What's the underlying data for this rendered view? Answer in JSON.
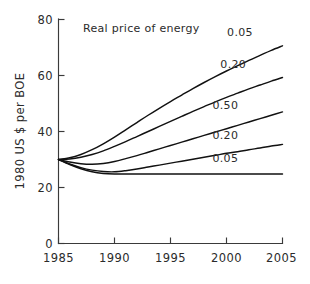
{
  "chart_data": {
    "type": "line",
    "title": "Real price of energy",
    "xlabel": "",
    "ylabel": "1980 US $ per BOE",
    "xlim": [
      1985,
      2005
    ],
    "ylim": [
      0,
      80
    ],
    "xticks": [
      "1985",
      "1990",
      "1995",
      "2000",
      "2005"
    ],
    "xtick_values": [
      1985,
      1990,
      1995,
      2000,
      2005
    ],
    "yticks": [
      "0",
      "20",
      "40",
      "60",
      "80"
    ],
    "ytick_values": [
      0,
      20,
      40,
      60,
      80
    ],
    "grid": false,
    "legend_position": "inline-right-labels",
    "x": [
      1985,
      1986,
      1987,
      1988,
      1989,
      1990,
      1991,
      1992,
      1993,
      1994,
      1995,
      1996,
      1997,
      1998,
      1999,
      2000,
      2001,
      2002,
      2003,
      2004,
      2005
    ],
    "series": [
      {
        "name": "0.05",
        "label": "0.05",
        "label_value": 0.05,
        "values": [
          30.0,
          30.6,
          31.8,
          33.5,
          35.6,
          38.0,
          40.6,
          43.2,
          45.8,
          48.3,
          50.7,
          53.0,
          55.3,
          57.5,
          59.6,
          61.6,
          63.5,
          65.4,
          67.2,
          69.0,
          70.6
        ]
      },
      {
        "name": "0.20-upper",
        "label": "0.20",
        "label_value": 0.2,
        "values": [
          30.0,
          30.2,
          30.8,
          31.8,
          33.1,
          34.7,
          36.4,
          38.2,
          40.0,
          41.8,
          43.6,
          45.4,
          47.2,
          48.9,
          50.6,
          52.2,
          53.7,
          55.2,
          56.6,
          58.0,
          59.3
        ]
      },
      {
        "name": "0.50",
        "label": "0.50",
        "label_value": 0.5,
        "values": [
          30.0,
          29.1,
          28.5,
          28.3,
          28.6,
          29.3,
          30.3,
          31.4,
          32.6,
          33.8,
          35.0,
          36.2,
          37.4,
          38.6,
          39.8,
          41.0,
          42.2,
          43.4,
          44.6,
          45.8,
          47.0
        ]
      },
      {
        "name": "0.20-lower",
        "label": "0.20",
        "label_value": 0.2,
        "values": [
          30.0,
          28.4,
          27.1,
          26.2,
          25.7,
          25.6,
          26.0,
          26.6,
          27.3,
          28.0,
          28.7,
          29.4,
          30.1,
          30.8,
          31.5,
          32.2,
          32.8,
          33.5,
          34.1,
          34.8,
          35.4
        ]
      },
      {
        "name": "0.05-lower",
        "label": "0.05",
        "label_value": 0.05,
        "values": [
          30.0,
          28.2,
          26.7,
          25.6,
          25.0,
          24.8,
          24.8,
          24.8,
          24.8,
          24.8,
          24.8,
          24.8,
          24.8,
          24.8,
          24.8,
          24.8,
          24.8,
          24.8,
          24.8,
          24.8,
          24.8
        ]
      }
    ],
    "curve_labels": [
      {
        "text": "0.05",
        "x": 2001.2,
        "y": 74.0
      },
      {
        "text": "0.20",
        "x": 2000.6,
        "y": 62.8
      },
      {
        "text": "0.50",
        "x": 1999.9,
        "y": 48.0
      },
      {
        "text": "0.20",
        "x": 1999.9,
        "y": 37.4
      },
      {
        "text": "0.05",
        "x": 1999.9,
        "y": 29.2
      }
    ],
    "colors": {
      "curve": "#111111",
      "axis": "#3a3a3a",
      "text": "#2b2b2b",
      "background": "#ffffff"
    }
  }
}
